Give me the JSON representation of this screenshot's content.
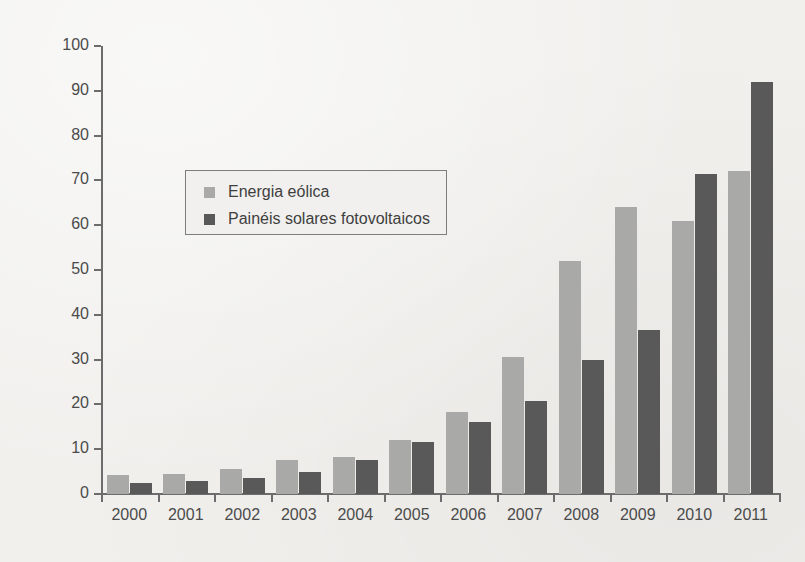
{
  "figure": {
    "cut_off_title": "",
    "background_color": "#f1f0ed"
  },
  "axis": {
    "ylabel": "$ bilhões",
    "ytick_labels": [
      "0",
      "10",
      "20",
      "30",
      "40",
      "50",
      "60",
      "70",
      "80",
      "90",
      "100"
    ],
    "xtick_labels": [
      "2000",
      "2001",
      "2002",
      "2003",
      "2004",
      "2005",
      "2006",
      "2007",
      "2008",
      "2009",
      "2010",
      "2011"
    ]
  },
  "legend": {
    "entries": [
      {
        "label": "Energia eólica",
        "color": "#a9a9a7"
      },
      {
        "label": "Painéis solares fotovoltaicos",
        "color": "#59595a"
      }
    ]
  },
  "chart_data": {
    "type": "bar",
    "title": "",
    "xlabel": "",
    "ylabel": "$ bilhões",
    "ylim": [
      0,
      100
    ],
    "ytick_step": 10,
    "grid": false,
    "legend_position": "inside-upper-left",
    "categories": [
      "2000",
      "2001",
      "2002",
      "2003",
      "2004",
      "2005",
      "2006",
      "2007",
      "2008",
      "2009",
      "2010",
      "2011"
    ],
    "series": [
      {
        "name": "Energia eólica",
        "color": "#a9a9a7",
        "values": [
          4.2,
          4.5,
          5.5,
          7.5,
          8.2,
          12.0,
          18.3,
          30.5,
          52.0,
          64.0,
          61.0,
          72.0
        ]
      },
      {
        "name": "Painéis solares fotovoltaicos",
        "color": "#59595a",
        "values": [
          2.5,
          3.0,
          3.5,
          5.0,
          7.5,
          11.5,
          16.0,
          20.7,
          30.0,
          36.5,
          71.5,
          92.0
        ]
      }
    ]
  }
}
